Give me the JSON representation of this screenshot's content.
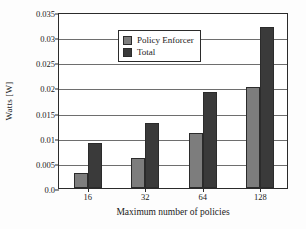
{
  "chart_data": {
    "type": "bar",
    "title": "",
    "xlabel": "Maximum number of policies",
    "ylabel": "Watts [W]",
    "categories": [
      "16",
      "32",
      "64",
      "128"
    ],
    "series": [
      {
        "name": "Policy Enforcer",
        "color": "#7d7d7d",
        "values": [
          0.003,
          0.006,
          0.011,
          0.02
        ]
      },
      {
        "name": "Total",
        "color": "#3a3a3a",
        "values": [
          0.009,
          0.013,
          0.019,
          0.032
        ]
      }
    ],
    "ylim": [
      0,
      0.035
    ],
    "yticks": [
      0,
      0.005,
      0.01,
      0.015,
      0.02,
      0.025,
      0.03,
      0.035
    ],
    "ytick_labels": [
      "0.0",
      "0.005",
      "0.01",
      "0.015",
      "0.02",
      "0.025",
      "0.03",
      "0.035"
    ],
    "grid": true,
    "grid_axis": "y",
    "legend_position": "top-left"
  }
}
